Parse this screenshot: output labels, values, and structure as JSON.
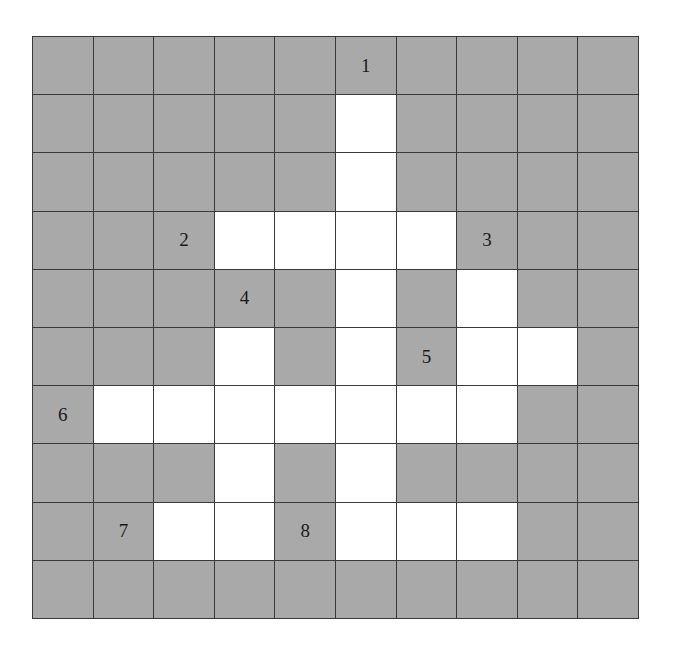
{
  "puzzle": {
    "type": "crossword-grid",
    "rows": 10,
    "cols": 10,
    "colors": {
      "block": "#a9a9a9",
      "open": "#ffffff",
      "line": "#3a3a3a",
      "number": "#1a1a1a"
    },
    "layout": [
      [
        0,
        0,
        0,
        0,
        0,
        0,
        0,
        0,
        0,
        0
      ],
      [
        0,
        0,
        0,
        0,
        0,
        1,
        0,
        0,
        0,
        0
      ],
      [
        0,
        0,
        0,
        0,
        0,
        1,
        0,
        0,
        0,
        0
      ],
      [
        0,
        0,
        0,
        1,
        1,
        1,
        1,
        0,
        0,
        0
      ],
      [
        0,
        0,
        0,
        0,
        0,
        1,
        0,
        1,
        0,
        0
      ],
      [
        0,
        0,
        0,
        1,
        0,
        1,
        0,
        1,
        1,
        0
      ],
      [
        0,
        1,
        1,
        1,
        1,
        1,
        1,
        1,
        0,
        0
      ],
      [
        0,
        0,
        0,
        1,
        0,
        1,
        0,
        0,
        0,
        0
      ],
      [
        0,
        0,
        1,
        1,
        0,
        1,
        1,
        1,
        0,
        0
      ],
      [
        0,
        0,
        0,
        0,
        0,
        0,
        0,
        0,
        0,
        0
      ]
    ],
    "clue_numbers": [
      {
        "label": "1",
        "row": 0,
        "col": 5
      },
      {
        "label": "2",
        "row": 3,
        "col": 2
      },
      {
        "label": "3",
        "row": 3,
        "col": 7
      },
      {
        "label": "4",
        "row": 4,
        "col": 3
      },
      {
        "label": "5",
        "row": 5,
        "col": 6
      },
      {
        "label": "6",
        "row": 6,
        "col": 0
      },
      {
        "label": "7",
        "row": 8,
        "col": 1
      },
      {
        "label": "8",
        "row": 8,
        "col": 4
      }
    ]
  }
}
